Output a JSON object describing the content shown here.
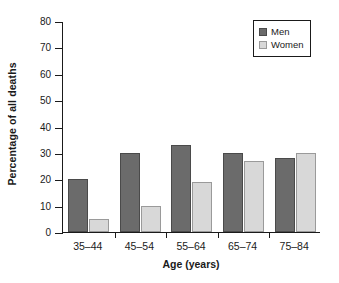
{
  "chart_data": {
    "type": "bar",
    "title": "",
    "subtitle": "",
    "xlabel": "Age (years)",
    "ylabel": "Percentage of all deaths",
    "categories": [
      "35–44",
      "45–54",
      "55–64",
      "65–74",
      "75–84"
    ],
    "series": [
      {
        "name": "Men",
        "values": [
          20,
          30,
          33,
          30,
          28
        ],
        "color": "#6b6b6b"
      },
      {
        "name": "Women",
        "values": [
          5,
          10,
          19,
          27,
          30
        ],
        "color": "#d8d8d8"
      }
    ],
    "ylim": [
      0,
      80
    ],
    "ytick_labels": [
      "0",
      "10",
      "20",
      "30",
      "40",
      "50",
      "60",
      "70",
      "80"
    ],
    "ytick_values": [
      0,
      10,
      20,
      30,
      40,
      50,
      60,
      70,
      80
    ],
    "grid": false,
    "legend_position": "top-right",
    "legend_entries": [
      "Men",
      "Women"
    ],
    "axis_color": "#1a1a1a",
    "background_color": "#ffffff"
  }
}
